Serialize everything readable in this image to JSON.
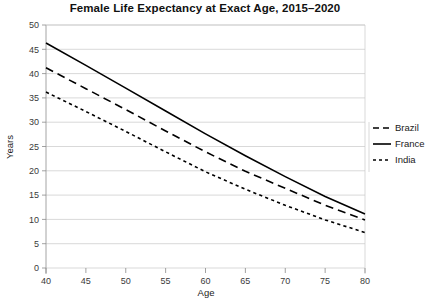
{
  "chart_data": {
    "type": "line",
    "title": "Female Life Expectancy at Exact Age, 2015–2020",
    "xlabel": "Age",
    "ylabel": "Years",
    "xlim": [
      40,
      80
    ],
    "ylim": [
      0,
      50
    ],
    "xticks": [
      40,
      45,
      50,
      55,
      60,
      65,
      70,
      75,
      80
    ],
    "yticks": [
      0,
      5,
      10,
      15,
      20,
      25,
      30,
      35,
      40,
      45,
      50
    ],
    "grid": true,
    "legend_position": "right",
    "x": [
      40,
      45,
      50,
      55,
      60,
      65,
      70,
      75,
      80
    ],
    "series": [
      {
        "name": "Brazil",
        "dash": "long-dash",
        "color": "#000000",
        "values": [
          41.2,
          36.9,
          32.6,
          28.2,
          23.9,
          19.9,
          16.4,
          12.9,
          9.9
        ]
      },
      {
        "name": "France",
        "dash": "solid",
        "color": "#000000",
        "values": [
          46.3,
          41.7,
          37.0,
          32.3,
          27.6,
          23.1,
          18.8,
          14.7,
          11.1
        ]
      },
      {
        "name": "India",
        "dash": "short-dash",
        "color": "#000000",
        "values": [
          36.2,
          32.2,
          28.1,
          23.9,
          19.8,
          16.2,
          12.9,
          9.9,
          7.3
        ]
      }
    ]
  },
  "legend": {
    "items": [
      {
        "label": "Brazil",
        "dash": "long-dash"
      },
      {
        "label": "France",
        "dash": "solid"
      },
      {
        "label": "India",
        "dash": "short-dash"
      }
    ]
  },
  "axes": {
    "x_tick_labels": [
      "40",
      "45",
      "50",
      "55",
      "60",
      "65",
      "70",
      "75",
      "80"
    ],
    "y_tick_labels": [
      "0",
      "5",
      "10",
      "15",
      "20",
      "25",
      "30",
      "35",
      "40",
      "45",
      "50"
    ],
    "x_title": "Age",
    "y_title": "Years"
  }
}
